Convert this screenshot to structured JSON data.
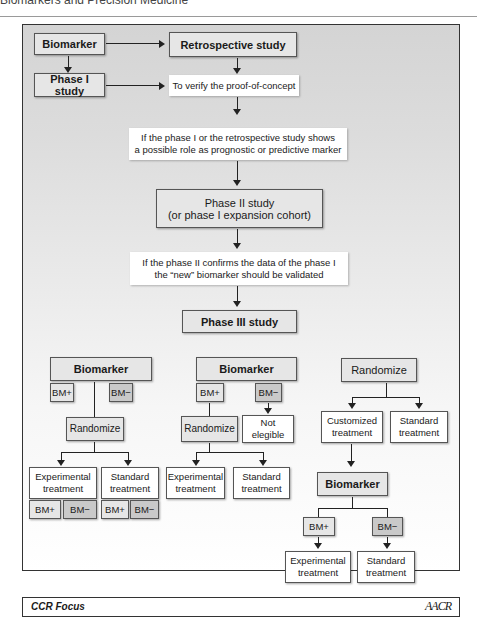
{
  "header": {
    "title": "Biomarkers and Precision Medicine"
  },
  "flow": {
    "biomarker": "Biomarker",
    "retrospective": "Retrospective study",
    "phase1": "Phase I study",
    "verify": "To verify the proof-of-concept",
    "condition1_line1": "If the phase I or the retrospective study shows",
    "condition1_line2": "a possible role as prognostic or predictive marker",
    "phase2_line1": "Phase II study",
    "phase2_line2": "(or phase I expansion cohort)",
    "condition2_line1": "If the phase II confirms the data of the phase I",
    "condition2_line2": "the “new” biomarker should be validated",
    "phase3": "Phase III study"
  },
  "designs": [
    {
      "name": "all-comers",
      "biomarker": "Biomarker",
      "bm_pos": "BM+",
      "bm_neg": "BM−",
      "randomize": "Randomize",
      "arm1_line1": "Experimental",
      "arm1_line2": "treatment",
      "arm2_line1": "Standard",
      "arm2_line2": "treatment",
      "sub_pos": "BM+",
      "sub_neg": "BM−"
    },
    {
      "name": "enrichment",
      "biomarker": "Biomarker",
      "bm_pos": "BM+",
      "bm_neg": "BM−",
      "randomize": "Randomize",
      "not_eligible_line1": "Not",
      "not_eligible_line2": "elegible",
      "arm1_line1": "Experimental",
      "arm1_line2": "treatment",
      "arm2_line1": "Standard",
      "arm2_line2": "treatment"
    },
    {
      "name": "strategy",
      "randomize": "Randomize",
      "custom_line1": "Customized",
      "custom_line2": "treatment",
      "standard_line1": "Standard",
      "standard_line2": "treatment",
      "biomarker": "Biomarker",
      "bm_pos": "BM+",
      "bm_neg": "BM−",
      "arm1_line1": "Experimental",
      "arm1_line2": "treatment",
      "arm2_line1": "Standard",
      "arm2_line2": "treatment"
    }
  ],
  "footer": {
    "label": "CCR Focus",
    "logo": "AACR"
  }
}
